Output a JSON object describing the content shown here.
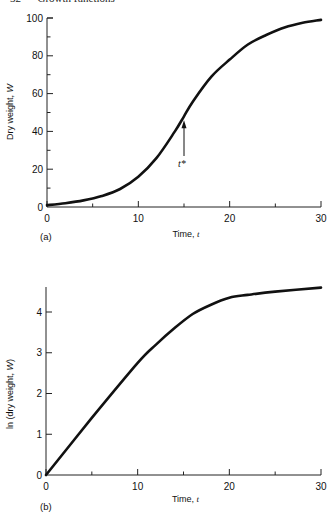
{
  "page_header": "32      Growth functions",
  "chart_data": [
    {
      "type": "line",
      "panel_label": "(a)",
      "title": "",
      "xlabel": "Time, t",
      "ylabel": "Dry weight, W",
      "xlim": [
        0,
        30
      ],
      "ylim": [
        0,
        100
      ],
      "x_ticks": [
        0,
        10,
        20,
        30
      ],
      "x_minor_ticks": [
        5,
        15,
        25
      ],
      "y_ticks": [
        0,
        20,
        40,
        60,
        80,
        100
      ],
      "y_minor_ticks": [
        10,
        30,
        50,
        70,
        90
      ],
      "grid": false,
      "legend": null,
      "annotation": {
        "text": "t*",
        "x": 15,
        "points_to_y": 48,
        "description": "arrow marking inflection point"
      },
      "series": [
        {
          "name": "W",
          "x": [
            0,
            2,
            4,
            6,
            8,
            10,
            12,
            14,
            15,
            16,
            18,
            20,
            22,
            24,
            26,
            28,
            30
          ],
          "y": [
            1,
            2,
            3.5,
            5.8,
            9.5,
            16,
            26,
            40,
            48,
            56,
            69,
            78,
            86,
            91,
            95,
            97.5,
            99
          ]
        }
      ]
    },
    {
      "type": "line",
      "panel_label": "(b)",
      "title": "",
      "xlabel": "Time, t",
      "ylabel": "ln (dry weight, W)",
      "xlim": [
        0,
        30
      ],
      "ylim": [
        0,
        4.6
      ],
      "x_ticks": [
        0,
        10,
        20,
        30
      ],
      "x_minor_ticks": [
        5,
        15,
        25
      ],
      "y_ticks": [
        0,
        1,
        2,
        3,
        4
      ],
      "grid": false,
      "legend": null,
      "series": [
        {
          "name": "ln W",
          "x": [
            0,
            5,
            10,
            12,
            14,
            16,
            18,
            20,
            22,
            25,
            30
          ],
          "y": [
            0,
            1.4,
            2.75,
            3.2,
            3.6,
            3.95,
            4.18,
            4.35,
            4.42,
            4.5,
            4.6
          ]
        }
      ]
    }
  ]
}
